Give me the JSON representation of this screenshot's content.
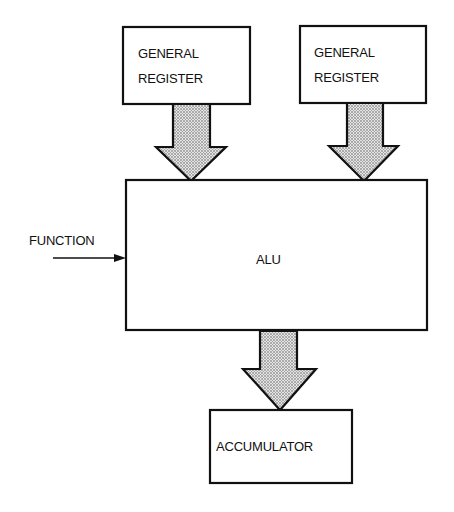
{
  "diagram": {
    "title": "",
    "colors": {
      "stroke": "#111111",
      "background": "#ffffff",
      "arrow_fill_pattern": "stippled-gray"
    },
    "nodes": [
      {
        "id": "gr1",
        "label_lines": [
          "GENERAL",
          "REGISTER"
        ]
      },
      {
        "id": "gr2",
        "label_lines": [
          "GENERAL",
          "REGISTER"
        ]
      },
      {
        "id": "alu",
        "label": "ALU"
      },
      {
        "id": "acc",
        "label": "ACCUMULATOR"
      }
    ],
    "inputs": [
      {
        "id": "function",
        "label": "FUNCTION",
        "target": "alu"
      }
    ],
    "edges": [
      {
        "from": "gr1",
        "to": "alu",
        "style": "wide-stippled-arrow"
      },
      {
        "from": "gr2",
        "to": "alu",
        "style": "wide-stippled-arrow"
      },
      {
        "from": "alu",
        "to": "acc",
        "style": "wide-stippled-arrow"
      },
      {
        "from": "function",
        "to": "alu",
        "style": "thin-line-arrow"
      }
    ]
  }
}
